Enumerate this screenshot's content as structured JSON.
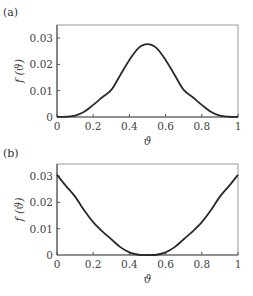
{
  "chart_data": [
    {
      "panel": "(a)",
      "type": "line",
      "title": "",
      "xlabel": "ϑ",
      "ylabel": "f (ϑ)",
      "xlim": [
        0,
        1
      ],
      "ylim": [
        0,
        0.035
      ],
      "xticks": [
        "0",
        "0.2",
        "0.4",
        "0.6",
        "0.8",
        "1"
      ],
      "yticks": [
        "0",
        "0.01",
        "0.02",
        "0.03"
      ],
      "grid": false,
      "series": [
        {
          "name": "f(ϑ)",
          "x": [
            0,
            0.05,
            0.1,
            0.15,
            0.2,
            0.25,
            0.3,
            0.35,
            0.4,
            0.45,
            0.5,
            0.55,
            0.6,
            0.65,
            0.7,
            0.75,
            0.8,
            0.85,
            0.9,
            0.95,
            1
          ],
          "values": [
            0,
            0.0001,
            0.0005,
            0.002,
            0.0046,
            0.0075,
            0.0103,
            0.016,
            0.0217,
            0.0262,
            0.0277,
            0.0262,
            0.0217,
            0.016,
            0.0103,
            0.0075,
            0.0046,
            0.002,
            0.0005,
            0.0001,
            0
          ]
        }
      ]
    },
    {
      "panel": "(b)",
      "type": "line",
      "title": "",
      "xlabel": "ϑ",
      "ylabel": "f (ϑ)",
      "xlim": [
        0,
        1
      ],
      "ylim": [
        0,
        0.035
      ],
      "xticks": [
        "0",
        "0.2",
        "0.4",
        "0.6",
        "0.8",
        "1"
      ],
      "yticks": [
        "0",
        "0.01",
        "0.02",
        "0.03"
      ],
      "grid": false,
      "series": [
        {
          "name": "f(ϑ)",
          "x": [
            0,
            0.05,
            0.1,
            0.15,
            0.2,
            0.25,
            0.3,
            0.35,
            0.4,
            0.45,
            0.5,
            0.55,
            0.6,
            0.65,
            0.7,
            0.75,
            0.8,
            0.85,
            0.9,
            0.95,
            1
          ],
          "values": [
            0.0305,
            0.0262,
            0.0222,
            0.017,
            0.0125,
            0.009,
            0.006,
            0.003,
            0.001,
            0.0001,
            0,
            0.0001,
            0.001,
            0.003,
            0.006,
            0.009,
            0.0125,
            0.017,
            0.0222,
            0.0262,
            0.0305
          ]
        }
      ]
    }
  ],
  "panels": [
    {
      "label": "(a)",
      "ylabel": "f (ϑ)",
      "xlabel": "ϑ",
      "xticks": [
        "0",
        "0.2",
        "0.4",
        "0.6",
        "0.8",
        "1"
      ],
      "yticks": [
        "0",
        "0.01",
        "0.02",
        "0.03"
      ]
    },
    {
      "label": "(b)",
      "ylabel": "f (ϑ)",
      "xlabel": "ϑ",
      "xticks": [
        "0",
        "0.2",
        "0.4",
        "0.6",
        "0.8",
        "1"
      ],
      "yticks": [
        "0",
        "0.01",
        "0.02",
        "0.03"
      ]
    }
  ],
  "colors": {
    "line": "#2a2a2a",
    "axes": "#555555",
    "text": "#444444"
  }
}
